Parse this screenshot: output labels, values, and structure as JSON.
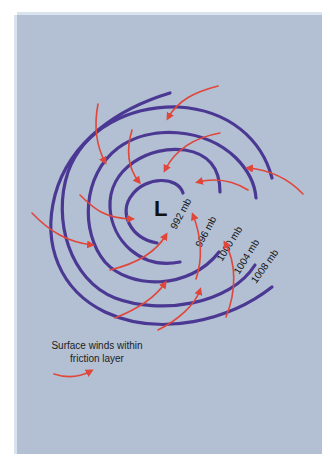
{
  "diagram": {
    "center_label": "L",
    "isobars": [
      {
        "label": "992 mb",
        "value_mb": 992
      },
      {
        "label": "996 mb",
        "value_mb": 996
      },
      {
        "label": "1000 mb",
        "value_mb": 1000
      },
      {
        "label": "1004 mb",
        "value_mb": 1004
      },
      {
        "label": "1008 mb",
        "value_mb": 1008
      }
    ],
    "colors": {
      "background": "#b3bfd3",
      "isobar": "#4a3893",
      "wind_arrow": "#e0463a"
    }
  },
  "legend": {
    "text": "Surface winds within friction layer",
    "line1": "Surface winds within",
    "line2": "friction layer",
    "icon": "red-curved-arrow"
  }
}
